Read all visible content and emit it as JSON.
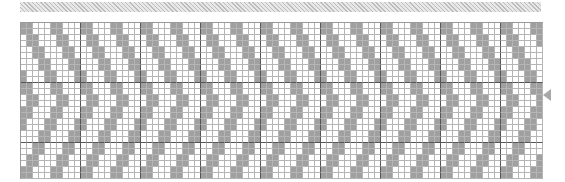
{
  "pattern": {
    "type": "chevron-chart",
    "columns": 87,
    "rows": 26,
    "period": 5,
    "band_width": 2,
    "rows_per_step": 2,
    "major_every": 10,
    "colors": {
      "on": "#a0a0a0",
      "off": "#ffffff",
      "grid": "#b5b5b5",
      "major": "#555555"
    }
  },
  "marker": {
    "row": 12,
    "direction": "left"
  }
}
